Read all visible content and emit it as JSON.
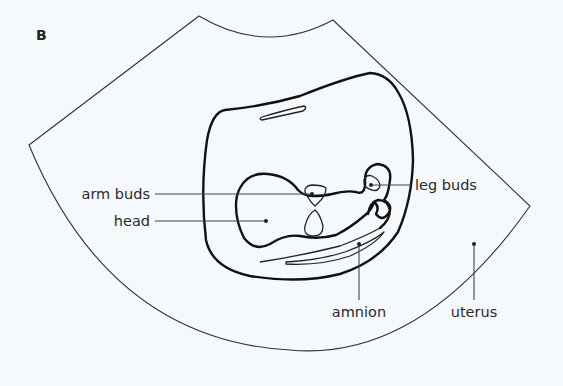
{
  "figure": {
    "panel_label": "B",
    "labels": {
      "arm_buds": "arm buds",
      "head": "head",
      "leg_buds": "leg buds",
      "amnion": "amnion",
      "uterus": "uterus"
    },
    "colors": {
      "background": "#f6f9fc",
      "line": "#111111",
      "text": "#2a2a2a"
    }
  }
}
